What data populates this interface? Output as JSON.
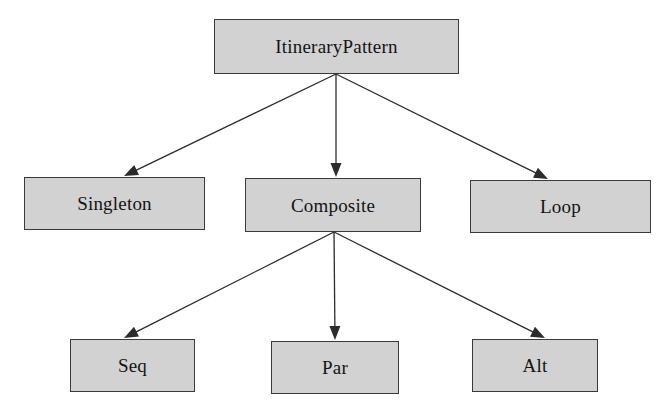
{
  "diagram": {
    "type": "hierarchy-tree",
    "background_color": "#ffffff",
    "node_fill_color": "#d2d2d2",
    "node_border_color": "#3a3a3a",
    "edge_color": "#2b2b2b",
    "text_color": "#141414",
    "nodes": [
      {
        "id": "itinerarypattern",
        "label": "ItineraryPattern",
        "level": 0
      },
      {
        "id": "singleton",
        "label": "Singleton",
        "level": 1
      },
      {
        "id": "composite",
        "label": "Composite",
        "level": 1
      },
      {
        "id": "loop",
        "label": "Loop",
        "level": 1
      },
      {
        "id": "seq",
        "label": "Seq",
        "level": 2
      },
      {
        "id": "par",
        "label": "Par",
        "level": 2
      },
      {
        "id": "alt",
        "label": "Alt",
        "level": 2
      }
    ],
    "edges": [
      {
        "from": "itinerarypattern",
        "to": "singleton",
        "x1": 336,
        "y1": 74,
        "x2": 124,
        "y2": 176
      },
      {
        "from": "itinerarypattern",
        "to": "composite",
        "x1": 336,
        "y1": 74,
        "x2": 336,
        "y2": 177
      },
      {
        "from": "itinerarypattern",
        "to": "loop",
        "x1": 336,
        "y1": 74,
        "x2": 548,
        "y2": 179
      },
      {
        "from": "composite",
        "to": "seq",
        "x1": 334,
        "y1": 232,
        "x2": 124,
        "y2": 338
      },
      {
        "from": "composite",
        "to": "par",
        "x1": 334,
        "y1": 232,
        "x2": 335,
        "y2": 340
      },
      {
        "from": "composite",
        "to": "alt",
        "x1": 334,
        "y1": 232,
        "x2": 545,
        "y2": 338
      }
    ]
  }
}
